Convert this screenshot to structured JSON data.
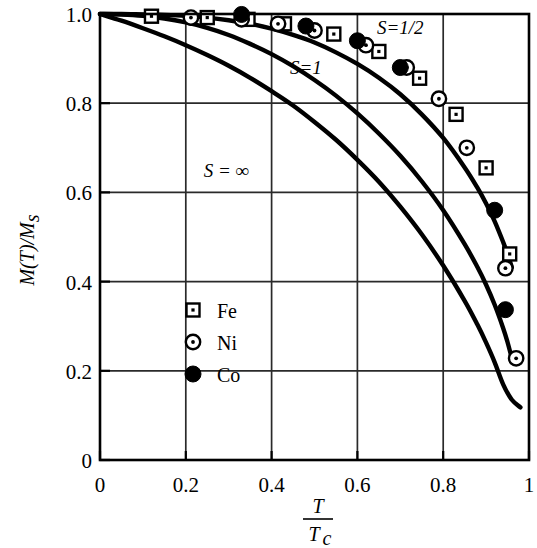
{
  "chart_data": {
    "type": "line",
    "title": "",
    "xlabel": "T/Tc",
    "ylabel": "M(T)/Ms",
    "xlabel_parts": {
      "numerator": "T",
      "denominator": "T",
      "denominator_sub": "c"
    },
    "ylabel_parts": {
      "text": "M(T)/M",
      "sub": "s"
    },
    "xlim": [
      0,
      1
    ],
    "ylim": [
      0,
      1
    ],
    "grid": true,
    "x_ticks": [
      0,
      0.2,
      0.4,
      0.6,
      0.8,
      1
    ],
    "x_ticklabels": [
      "0",
      "0.2",
      "0.4",
      "0.6",
      "0.8",
      "1"
    ],
    "y_ticks": [
      0,
      0.2,
      0.4,
      0.6,
      0.8,
      1.0
    ],
    "y_ticklabels": [
      "0",
      "0.2",
      "0.4",
      "0.6",
      "0.8",
      "1.0"
    ],
    "annotations": [
      {
        "text": "S=1/2",
        "x": 0.7,
        "y": 0.955
      },
      {
        "text": "S=1",
        "x": 0.48,
        "y": 0.865
      },
      {
        "text": "S = ∞",
        "x": 0.295,
        "y": 0.635
      }
    ],
    "series": [
      {
        "name": "S=1/2",
        "kind": "curve",
        "points": [
          [
            0.0,
            1.0
          ],
          [
            0.05,
            1.0
          ],
          [
            0.1,
            0.999
          ],
          [
            0.15,
            0.998
          ],
          [
            0.2,
            0.996
          ],
          [
            0.25,
            0.992
          ],
          [
            0.3,
            0.986
          ],
          [
            0.35,
            0.978
          ],
          [
            0.4,
            0.967
          ],
          [
            0.45,
            0.953
          ],
          [
            0.5,
            0.936
          ],
          [
            0.55,
            0.914
          ],
          [
            0.6,
            0.888
          ],
          [
            0.65,
            0.857
          ],
          [
            0.7,
            0.82
          ],
          [
            0.75,
            0.775
          ],
          [
            0.8,
            0.722
          ],
          [
            0.85,
            0.656
          ],
          [
            0.88,
            0.61
          ],
          [
            0.9,
            0.575
          ],
          [
            0.92,
            0.535
          ],
          [
            0.94,
            0.488
          ],
          [
            0.95,
            0.462
          ],
          [
            0.96,
            0.432
          ]
        ]
      },
      {
        "name": "S=1",
        "kind": "curve",
        "points": [
          [
            0.0,
            1.0
          ],
          [
            0.05,
            0.999
          ],
          [
            0.1,
            0.996
          ],
          [
            0.15,
            0.99
          ],
          [
            0.2,
            0.981
          ],
          [
            0.25,
            0.969
          ],
          [
            0.3,
            0.953
          ],
          [
            0.35,
            0.933
          ],
          [
            0.4,
            0.91
          ],
          [
            0.45,
            0.883
          ],
          [
            0.5,
            0.852
          ],
          [
            0.55,
            0.817
          ],
          [
            0.6,
            0.777
          ],
          [
            0.65,
            0.732
          ],
          [
            0.7,
            0.682
          ],
          [
            0.75,
            0.625
          ],
          [
            0.8,
            0.56
          ],
          [
            0.85,
            0.484
          ],
          [
            0.88,
            0.432
          ],
          [
            0.9,
            0.393
          ],
          [
            0.92,
            0.348
          ],
          [
            0.94,
            0.295
          ],
          [
            0.95,
            0.264
          ],
          [
            0.96,
            0.228
          ]
        ]
      },
      {
        "name": "S = ∞",
        "kind": "curve",
        "points": [
          [
            0.0,
            1.0
          ],
          [
            0.05,
            0.985
          ],
          [
            0.1,
            0.968
          ],
          [
            0.15,
            0.95
          ],
          [
            0.2,
            0.93
          ],
          [
            0.25,
            0.908
          ],
          [
            0.3,
            0.884
          ],
          [
            0.35,
            0.857
          ],
          [
            0.4,
            0.827
          ],
          [
            0.45,
            0.795
          ],
          [
            0.5,
            0.758
          ],
          [
            0.55,
            0.718
          ],
          [
            0.6,
            0.673
          ],
          [
            0.65,
            0.624
          ],
          [
            0.7,
            0.568
          ],
          [
            0.75,
            0.506
          ],
          [
            0.8,
            0.436
          ],
          [
            0.85,
            0.357
          ],
          [
            0.88,
            0.303
          ],
          [
            0.9,
            0.263
          ],
          [
            0.92,
            0.219
          ],
          [
            0.94,
            0.169
          ],
          [
            0.96,
            0.135
          ],
          [
            0.98,
            0.118
          ]
        ]
      }
    ],
    "data_series": [
      {
        "name": "Fe",
        "marker": "open-square",
        "points": [
          [
            0.12,
            0.995
          ],
          [
            0.25,
            0.992
          ],
          [
            0.345,
            0.988
          ],
          [
            0.43,
            0.978
          ],
          [
            0.545,
            0.955
          ],
          [
            0.65,
            0.916
          ],
          [
            0.745,
            0.856
          ],
          [
            0.83,
            0.775
          ],
          [
            0.9,
            0.655
          ],
          [
            0.955,
            0.462
          ]
        ]
      },
      {
        "name": "Ni",
        "marker": "open-circle",
        "points": [
          [
            0.212,
            0.992
          ],
          [
            0.33,
            0.988
          ],
          [
            0.415,
            0.978
          ],
          [
            0.5,
            0.963
          ],
          [
            0.62,
            0.93
          ],
          [
            0.715,
            0.88
          ],
          [
            0.79,
            0.81
          ],
          [
            0.855,
            0.7
          ],
          [
            0.945,
            0.43
          ],
          [
            0.97,
            0.228
          ]
        ]
      },
      {
        "name": "Co",
        "marker": "filled-circle",
        "points": [
          [
            0.33,
            0.999
          ],
          [
            0.48,
            0.973
          ],
          [
            0.6,
            0.94
          ],
          [
            0.7,
            0.88
          ],
          [
            0.92,
            0.56
          ],
          [
            0.945,
            0.337
          ]
        ]
      }
    ]
  },
  "legend": {
    "position": "lower-left-inside",
    "entries": [
      {
        "label": "Fe",
        "marker": "open-square"
      },
      {
        "label": "Ni",
        "marker": "open-circle"
      },
      {
        "label": "Co",
        "marker": "filled-circle"
      }
    ]
  }
}
